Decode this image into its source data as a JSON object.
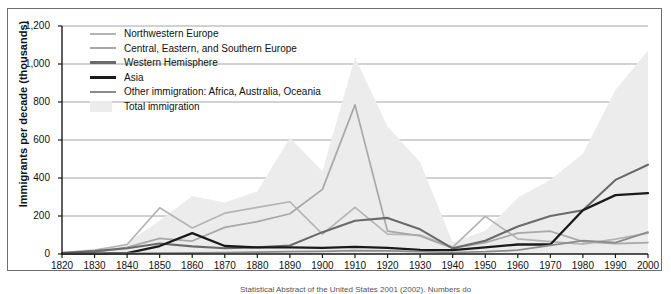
{
  "figure": {
    "background_color": "#ffffff",
    "frame_color": "#6e6e6e",
    "caption": "Statistical Abstract of the United States 2001 (2002). Numbers do"
  },
  "axes": {
    "ylabel": "Immigrants per decade (thousands)",
    "y_ticks": [
      "0",
      "200",
      "400",
      "600",
      "800",
      "1,000",
      "1,200"
    ],
    "y_tick_values": [
      0,
      200,
      400,
      600,
      800,
      1000,
      1200
    ],
    "x_ticks": [
      "1820",
      "1830",
      "1840",
      "1850",
      "1860",
      "1870",
      "1880",
      "1890",
      "1900",
      "1910",
      "1920",
      "1930",
      "1940",
      "1950",
      "1960",
      "1970",
      "1980",
      "1990",
      "2000"
    ],
    "gridline_color": "#9a9a9a",
    "axis_color": "#1a1a1a"
  },
  "legend": {
    "items": [
      {
        "label": "Northwestern Europe",
        "color": "#b4b4b4",
        "type": "line",
        "width": 2
      },
      {
        "label": "Central, Eastern, and Southern Europe",
        "color": "#a8a8a8",
        "type": "line",
        "width": 2
      },
      {
        "label": "Western Hemisphere",
        "color": "#6a6a6a",
        "type": "line",
        "width": 2.4
      },
      {
        "label": "Asia",
        "color": "#1a1a1a",
        "type": "line",
        "width": 2.6
      },
      {
        "label": "Other immigration: Africa, Australia, Oceania",
        "color": "#8c8c8c",
        "type": "line",
        "width": 2
      },
      {
        "label": "Total immigration",
        "color": "#ececec",
        "type": "area"
      }
    ]
  },
  "chart_data": {
    "type": "line",
    "title": "",
    "subtitle": "",
    "xlabel": "",
    "ylabel": "Immigrants per decade (thousands)",
    "xlim": [
      1820,
      2000
    ],
    "ylim": [
      0,
      1200
    ],
    "grid": true,
    "legend_position": "upper-left-inside",
    "x": [
      1820,
      1830,
      1840,
      1850,
      1860,
      1870,
      1880,
      1890,
      1900,
      1910,
      1920,
      1930,
      1940,
      1950,
      1960,
      1970,
      1980,
      1990,
      2000
    ],
    "series": [
      {
        "name": "Total immigration",
        "type": "area",
        "color": "#ececec",
        "values": [
          10,
          100,
          500,
          1500,
          2600,
          2300,
          2800,
          5200,
          3700,
          8800,
          5700,
          4100,
          530,
          1035,
          2515,
          3320,
          4490,
          7340,
          9100
        ]
      },
      {
        "name": "Northwestern Europe",
        "type": "line",
        "color": "#b4b4b4",
        "values": [
          8,
          20,
          50,
          243,
          137,
          215,
          245,
          275,
          105,
          245,
          105,
          100,
          35,
          198,
          80,
          65,
          52,
          78,
          110
        ]
      },
      {
        "name": "Central, Eastern, and Southern Europe",
        "type": "line",
        "color": "#a8a8a8",
        "values": [
          2,
          10,
          35,
          82,
          68,
          140,
          170,
          212,
          340,
          785,
          120,
          95,
          30,
          60,
          110,
          120,
          65,
          55,
          60
        ]
      },
      {
        "name": "Western Hemisphere",
        "type": "line",
        "color": "#6a6a6a",
        "values": [
          5,
          15,
          30,
          55,
          40,
          30,
          35,
          45,
          115,
          175,
          190,
          130,
          30,
          70,
          145,
          200,
          230,
          390,
          470
        ]
      },
      {
        "name": "Asia",
        "type": "line",
        "color": "#1a1a1a",
        "values": [
          1,
          2,
          5,
          42,
          110,
          42,
          35,
          35,
          32,
          38,
          32,
          22,
          20,
          35,
          50,
          50,
          230,
          310,
          320
        ]
      },
      {
        "name": "Other immigration: Africa, Australia, Oceania",
        "type": "line",
        "color": "#8c8c8c",
        "values": [
          1,
          2,
          3,
          5,
          6,
          8,
          10,
          12,
          14,
          18,
          16,
          12,
          8,
          12,
          20,
          45,
          70,
          60,
          115
        ]
      }
    ],
    "annotations": [
      {
        "text": "Central/Eastern/Southern Europe peak",
        "x": 1910,
        "y": 785
      },
      {
        "text": "Total immigration peak",
        "x": 1910,
        "y": 8800
      }
    ]
  }
}
